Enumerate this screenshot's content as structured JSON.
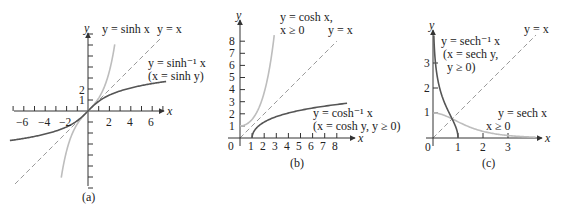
{
  "colors": {
    "dark_curve": "#555555",
    "light_curve": "#bdbdbd",
    "dashed": "#9a9a9a",
    "axis": "#333333"
  },
  "chart_data": [
    {
      "type": "line",
      "caption": "(a)",
      "xlabel": "x",
      "ylabel": "y",
      "xticks": [
        "−6",
        "−4",
        "−2",
        "2",
        "4",
        "6"
      ],
      "yticks": [
        "1",
        "2"
      ],
      "series": [
        {
          "name": "y = sinh x",
          "style": "light"
        },
        {
          "name": "y = x",
          "style": "dashed"
        },
        {
          "name": "y = sinh⁻¹ x (x = sinh y)",
          "style": "dark"
        }
      ],
      "labels": {
        "sinh": "y = sinh x",
        "identity": "y = x",
        "inv1": "y = sinh⁻¹ x",
        "inv2": "(x = sinh y)"
      }
    },
    {
      "type": "line",
      "caption": "(b)",
      "xlabel": "x",
      "ylabel": "y",
      "xticks": [
        "0",
        "1",
        "2",
        "3",
        "4",
        "5",
        "6",
        "7",
        "8"
      ],
      "yticks": [
        "1",
        "2",
        "3",
        "4",
        "5",
        "6",
        "7",
        "8"
      ],
      "series": [
        {
          "name": "y = cosh x, x ≥ 0",
          "style": "light"
        },
        {
          "name": "y = x",
          "style": "dashed"
        },
        {
          "name": "y = cosh⁻¹ x (x = cosh y, y ≥ 0)",
          "style": "dark"
        }
      ],
      "labels": {
        "cosh1": "y = cosh x,",
        "cosh2": "x ≥ 0",
        "identity": "y = x",
        "inv1": "y = cosh⁻¹ x",
        "inv2": "(x = cosh y, y ≥ 0)"
      }
    },
    {
      "type": "line",
      "caption": "(c)",
      "xlabel": "x",
      "ylabel": "y",
      "xticks": [
        "0",
        "1",
        "2",
        "3"
      ],
      "yticks": [
        "1",
        "2",
        "3"
      ],
      "series": [
        {
          "name": "y = sech⁻¹ x (x = sech y, y ≥ 0)",
          "style": "dark"
        },
        {
          "name": "y = x",
          "style": "dashed"
        },
        {
          "name": "y = sech x, x ≥ 0",
          "style": "light"
        }
      ],
      "labels": {
        "inv1": "y = sech⁻¹ x",
        "inv2": "(x = sech y,",
        "inv3": "y ≥ 0)",
        "identity": "y = x",
        "sech1": "y = sech x",
        "sech2": "x ≥ 0"
      }
    }
  ]
}
